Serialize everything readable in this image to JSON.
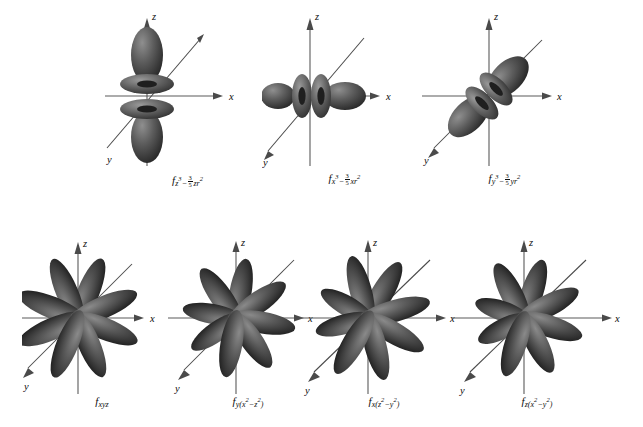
{
  "figure": {
    "kind": "f-orbital-shapes-diagram",
    "background_color": "#ffffff",
    "lobe_color": "#585858",
    "lobe_shadow_color": "#2a2a2a",
    "lobe_highlight_color": "#8d8d8d",
    "axis_color": "#555555",
    "axis_labels": {
      "x": "x",
      "y": "y",
      "z": "z"
    },
    "rows": 2,
    "total_orbitals": 7
  },
  "orbitals": [
    {
      "id": "fz3",
      "row": 1,
      "column": 1,
      "label_plain": "f z3 - 3/5 zr2",
      "f": "f",
      "sub_before": "z",
      "sub_before_exp": "3",
      "minus": "−",
      "frac_num": "3",
      "frac_den": "5",
      "sub_after": "zr",
      "sub_after_exp": "2",
      "shape": "two-lobes-two-tori",
      "axis": "z"
    },
    {
      "id": "fx3",
      "row": 1,
      "column": 2,
      "label_plain": "f x3 - 3/5 xr2",
      "f": "f",
      "sub_before": "x",
      "sub_before_exp": "3",
      "minus": "−",
      "frac_num": "3",
      "frac_den": "5",
      "sub_after": "xr",
      "sub_after_exp": "2",
      "shape": "two-lobes-two-tori",
      "axis": "x"
    },
    {
      "id": "fy3",
      "row": 1,
      "column": 3,
      "label_plain": "f y3 - 3/5 yr2",
      "f": "f",
      "sub_before": "y",
      "sub_before_exp": "3",
      "minus": "−",
      "frac_num": "3",
      "frac_den": "5",
      "sub_after": "yr",
      "sub_after_exp": "2",
      "shape": "two-lobes-two-tori",
      "axis": "y"
    },
    {
      "id": "fxyz",
      "row": 2,
      "column": 1,
      "label_plain": "f xyz",
      "f": "f",
      "sub_simple": "xyz",
      "shape": "eight-lobes",
      "axis": "xyz"
    },
    {
      "id": "fy_x2_z2",
      "row": 2,
      "column": 2,
      "label_plain": "f y(x2 - z2)",
      "f": "f",
      "sub_lead": "y(",
      "sub_a": "x",
      "sub_a_exp": "2",
      "minus": "−",
      "sub_b": "z",
      "sub_b_exp": "2",
      "sub_tail": ")",
      "shape": "eight-lobes",
      "axis": "y"
    },
    {
      "id": "fx_z2_y2",
      "row": 2,
      "column": 3,
      "label_plain": "f x(z2 - y2)",
      "f": "f",
      "sub_lead": "x(",
      "sub_a": "z",
      "sub_a_exp": "2",
      "minus": "−",
      "sub_b": "y",
      "sub_b_exp": "2",
      "sub_tail": ")",
      "shape": "eight-lobes",
      "axis": "x"
    },
    {
      "id": "fz_x2_y2",
      "row": 2,
      "column": 4,
      "label_plain": "f z(x2 - y2)",
      "f": "f",
      "sub_lead": "z(",
      "sub_a": "x",
      "sub_a_exp": "2",
      "minus": "−",
      "sub_b": "y",
      "sub_b_exp": "2",
      "sub_tail": ")",
      "shape": "eight-lobes",
      "axis": "z"
    }
  ]
}
